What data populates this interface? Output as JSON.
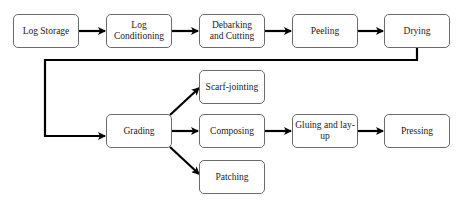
{
  "diagram": {
    "type": "flowchart",
    "nodes": {
      "log_storage": {
        "label": "Log Storage"
      },
      "log_conditioning": {
        "label": "Log Conditioning"
      },
      "debarking_cutting": {
        "label": "Debarking and Cutting"
      },
      "peeling": {
        "label": "Peeling"
      },
      "drying": {
        "label": "Drying"
      },
      "grading": {
        "label": "Grading"
      },
      "scarf_jointing": {
        "label": "Scarf-jointing"
      },
      "composing": {
        "label": "Composing"
      },
      "patching": {
        "label": "Patching"
      },
      "gluing_layup": {
        "label": "Gluing and lay-up"
      },
      "pressing": {
        "label": "Pressing"
      }
    },
    "edges": [
      {
        "from": "Log Storage",
        "to": "Log Conditioning"
      },
      {
        "from": "Log Conditioning",
        "to": "Debarking and Cutting"
      },
      {
        "from": "Debarking and Cutting",
        "to": "Peeling"
      },
      {
        "from": "Peeling",
        "to": "Drying"
      },
      {
        "from": "Drying",
        "to": "Grading"
      },
      {
        "from": "Grading",
        "to": "Scarf-jointing"
      },
      {
        "from": "Grading",
        "to": "Composing"
      },
      {
        "from": "Grading",
        "to": "Patching"
      },
      {
        "from": "Composing",
        "to": "Gluing and lay-up"
      },
      {
        "from": "Gluing and lay-up",
        "to": "Pressing"
      }
    ],
    "colors": {
      "stroke": "#000000",
      "node_border": "#6b6b6b",
      "background": "#ffffff"
    }
  }
}
